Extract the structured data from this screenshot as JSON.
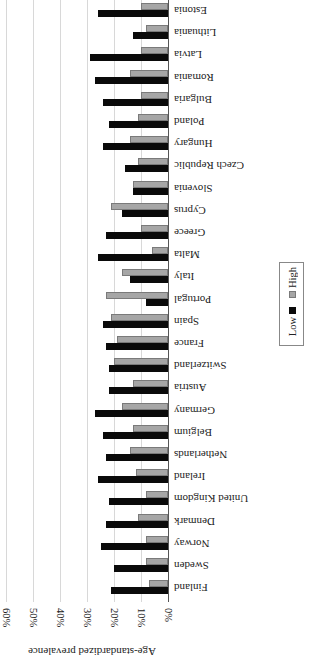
{
  "chart_data": {
    "type": "bar",
    "orientation": "horizontal (image rendered rotated 180°)",
    "title": "",
    "xlabel": "",
    "ylabel": "Age-standardized prevalence",
    "ylim": [
      0,
      60
    ],
    "ticks": [
      "0%",
      "10%",
      "20%",
      "30%",
      "40%",
      "50%",
      "60%"
    ],
    "grid": true,
    "legend_position": "right",
    "categories": [
      "Estonia",
      "Lithuania",
      "Latvia",
      "Romania",
      "Bulgaria",
      "Poland",
      "Hungary",
      "Czech Republic",
      "Slovenia",
      "Cyprus",
      "Greece",
      "Malta",
      "Italy",
      "Portugal",
      "Spain",
      "France",
      "Switzerland",
      "Austria",
      "Germany",
      "Belgium",
      "Netherlands",
      "Ireland",
      "United Kingdom",
      "Denmark",
      "Norway",
      "Sweden",
      "Finland"
    ],
    "series": [
      {
        "name": "High",
        "color": "#a6a6a6",
        "values": [
          10,
          8,
          10,
          14,
          10,
          11,
          14,
          11,
          13,
          21,
          10,
          6,
          17,
          23,
          21,
          19,
          20,
          13,
          17,
          13,
          14,
          12,
          8,
          11,
          8,
          8,
          7
        ]
      },
      {
        "name": "Low",
        "color": "#0a0a0a",
        "values": [
          26,
          13,
          29,
          27,
          24,
          22,
          24,
          16,
          13,
          17,
          23,
          26,
          14,
          8,
          24,
          23,
          22,
          22,
          27,
          24,
          23,
          26,
          22,
          23,
          25,
          20,
          21
        ]
      }
    ]
  },
  "legend": {
    "items": [
      {
        "label": "Low",
        "color": "#0a0a0a"
      },
      {
        "label": "High",
        "color": "#a6a6a6"
      }
    ]
  },
  "axis": {
    "title": "Age-standardized prevalence"
  }
}
